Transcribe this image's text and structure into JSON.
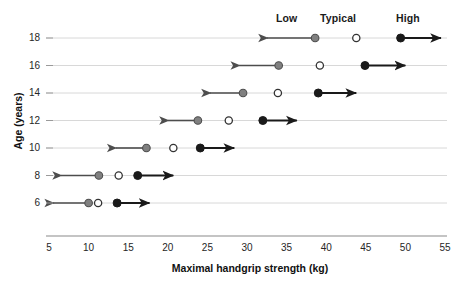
{
  "chart_data": {
    "type": "scatter",
    "title": "",
    "xlabel": "Maximal handgrip strength (kg)",
    "ylabel": "Age (years)",
    "xlim": [
      5,
      55
    ],
    "xticks": [
      5,
      10,
      15,
      20,
      25,
      30,
      35,
      40,
      45,
      50,
      55
    ],
    "yticks": [
      18,
      16,
      14,
      12,
      10,
      8,
      6
    ],
    "grid": true,
    "legend_position": "top",
    "group_labels": [
      "Low",
      "Typical",
      "High"
    ],
    "series": [
      {
        "name": "Low",
        "marker": "filled-gray-circle",
        "color": "#7d7d7d",
        "arrow": "left",
        "values": [
          38.6,
          34.0,
          29.5,
          23.8,
          17.3,
          11.3,
          10.0
        ]
      },
      {
        "name": "Typical",
        "marker": "open-circle",
        "color": "#ffffff",
        "arrow": "none",
        "values": [
          43.8,
          39.2,
          33.9,
          27.7,
          20.7,
          13.8,
          11.2
        ]
      },
      {
        "name": "High",
        "marker": "filled-black-circle",
        "color": "#1a1a1a",
        "arrow": "right",
        "values": [
          49.4,
          44.9,
          39.0,
          32.0,
          24.1,
          16.2,
          13.6
        ]
      }
    ],
    "categories": [
      18,
      16,
      14,
      12,
      10,
      8,
      6
    ],
    "rows": [
      {
        "age": 18,
        "low": 38.6,
        "typical": 43.8,
        "high": 49.4,
        "low_arrow_to": 32.0,
        "high_arrow_to": 55.0
      },
      {
        "age": 16,
        "low": 34.0,
        "typical": 39.2,
        "high": 44.9,
        "low_arrow_to": 28.5,
        "high_arrow_to": 50.5
      },
      {
        "age": 14,
        "low": 29.5,
        "typical": 33.9,
        "high": 39.0,
        "low_arrow_to": 24.8,
        "high_arrow_to": 44.3
      },
      {
        "age": 12,
        "low": 23.8,
        "typical": 27.7,
        "high": 32.0,
        "low_arrow_to": 19.5,
        "high_arrow_to": 36.8
      },
      {
        "age": 10,
        "low": 17.3,
        "typical": 20.7,
        "high": 24.1,
        "low_arrow_to": 12.9,
        "high_arrow_to": 28.9
      },
      {
        "age": 8,
        "low": 11.3,
        "typical": 13.8,
        "high": 16.2,
        "low_arrow_to": 6.0,
        "high_arrow_to": 21.2
      },
      {
        "age": 6,
        "low": 10.0,
        "typical": 11.2,
        "high": 13.6,
        "low_arrow_to": 5.0,
        "high_arrow_to": 18.2
      }
    ]
  },
  "axes": {
    "x_title": "Maximal handgrip strength (kg)",
    "y_title": "Age (years)",
    "x_tick_labels": [
      "5",
      "10",
      "15",
      "20",
      "25",
      "30",
      "35",
      "40",
      "45",
      "50",
      "55"
    ],
    "y_tick_labels": [
      "18",
      "16",
      "14",
      "12",
      "10",
      "8",
      "6"
    ]
  },
  "legend": {
    "low": "Low",
    "typical": "Typical",
    "high": "High"
  },
  "colors": {
    "low_fill": "#808080",
    "low_stroke": "#4d4d4d",
    "typical_fill": "#ffffff",
    "typical_stroke": "#333333",
    "high_fill": "#1a1a1a",
    "high_stroke": "#1a1a1a",
    "gridline": "#d8d8d8",
    "axis": "#8a8a8a",
    "text": "#1a1a1a"
  }
}
